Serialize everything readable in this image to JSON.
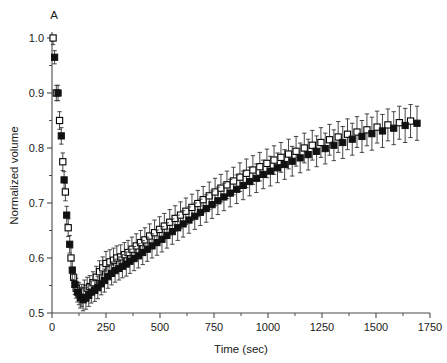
{
  "figure": {
    "panel_label": "A",
    "background": "#ffffff"
  },
  "chart_data": {
    "type": "scatter",
    "title": "",
    "panel_label": "A",
    "xlabel": "Time (sec)",
    "ylabel": "Normalized volume",
    "xlim": [
      0,
      1750
    ],
    "ylim": [
      0.5,
      1.0
    ],
    "xticks": [
      0,
      250,
      500,
      750,
      1000,
      1250,
      1500,
      1750
    ],
    "xticklabels": [
      "0",
      "250",
      "500",
      "750",
      "1000",
      "1250",
      "1500",
      "1750"
    ],
    "xminor_step": 125,
    "yticks": [
      0.5,
      0.6,
      0.7,
      0.8,
      0.9,
      1.0
    ],
    "yticklabels": [
      "0.5",
      "0.6",
      "0.7",
      "0.8",
      "0.9",
      "1.0"
    ],
    "yminor_step": 0.05,
    "grid": false,
    "legend": null,
    "errorbars": "symmetric",
    "marker_colors": {
      "open": "#ffffff",
      "filled": "#111111",
      "edge": "#000000"
    },
    "series": [
      {
        "name": "open-squares",
        "marker": "open-square",
        "x": [
          5,
          20,
          35,
          50,
          62,
          75,
          88,
          100,
          112,
          125,
          138,
          150,
          163,
          175,
          190,
          205,
          220,
          235,
          250,
          268,
          285,
          300,
          318,
          335,
          352,
          370,
          390,
          410,
          430,
          452,
          475,
          498,
          520,
          545,
          570,
          595,
          620,
          648,
          675,
          700,
          728,
          755,
          782,
          810,
          840,
          870,
          900,
          930,
          962,
          995,
          1028,
          1060,
          1095,
          1130,
          1168,
          1205,
          1245,
          1285,
          1325,
          1368,
          1412,
          1458,
          1505,
          1555,
          1608,
          1660
        ],
        "y": [
          1.0,
          0.9,
          0.85,
          0.775,
          0.72,
          0.655,
          0.6,
          0.565,
          0.545,
          0.535,
          0.532,
          0.54,
          0.545,
          0.548,
          0.555,
          0.565,
          0.575,
          0.582,
          0.59,
          0.593,
          0.596,
          0.6,
          0.602,
          0.606,
          0.61,
          0.616,
          0.622,
          0.628,
          0.633,
          0.64,
          0.646,
          0.652,
          0.658,
          0.665,
          0.672,
          0.678,
          0.685,
          0.692,
          0.699,
          0.706,
          0.713,
          0.72,
          0.727,
          0.733,
          0.74,
          0.747,
          0.754,
          0.76,
          0.766,
          0.772,
          0.778,
          0.783,
          0.789,
          0.794,
          0.8,
          0.805,
          0.81,
          0.815,
          0.82,
          0.825,
          0.829,
          0.833,
          0.838,
          0.842,
          0.846,
          0.849
        ],
        "yerr": [
          0.012,
          0.014,
          0.016,
          0.016,
          0.016,
          0.016,
          0.018,
          0.018,
          0.018,
          0.02,
          0.02,
          0.02,
          0.02,
          0.02,
          0.02,
          0.02,
          0.02,
          0.02,
          0.022,
          0.022,
          0.022,
          0.022,
          0.022,
          0.022,
          0.022,
          0.022,
          0.022,
          0.022,
          0.022,
          0.022,
          0.023,
          0.023,
          0.023,
          0.023,
          0.023,
          0.024,
          0.024,
          0.024,
          0.024,
          0.024,
          0.025,
          0.025,
          0.025,
          0.025,
          0.025,
          0.026,
          0.026,
          0.026,
          0.026,
          0.026,
          0.026,
          0.027,
          0.027,
          0.027,
          0.027,
          0.027,
          0.027,
          0.028,
          0.028,
          0.028,
          0.028,
          0.029,
          0.029,
          0.029,
          0.03,
          0.03
        ]
      },
      {
        "name": "filled-squares",
        "marker": "filled-square",
        "x": [
          12,
          28,
          43,
          56,
          68,
          82,
          94,
          106,
          118,
          131,
          144,
          157,
          170,
          182,
          198,
          212,
          228,
          243,
          259,
          276,
          292,
          310,
          326,
          344,
          361,
          380,
          400,
          420,
          441,
          463,
          486,
          509,
          532,
          557,
          582,
          607,
          634,
          661,
          687,
          714,
          741,
          768,
          796,
          825,
          855,
          885,
          915,
          946,
          978,
          1011,
          1044,
          1077,
          1112,
          1149,
          1186,
          1225,
          1265,
          1305,
          1346,
          1390,
          1435,
          1481,
          1530,
          1582,
          1635,
          1690
        ],
        "y": [
          0.965,
          0.9,
          0.822,
          0.742,
          0.678,
          0.625,
          0.578,
          0.552,
          0.538,
          0.528,
          0.524,
          0.527,
          0.532,
          0.538,
          0.541,
          0.546,
          0.553,
          0.559,
          0.566,
          0.572,
          0.577,
          0.581,
          0.585,
          0.589,
          0.594,
          0.599,
          0.604,
          0.61,
          0.616,
          0.622,
          0.628,
          0.634,
          0.641,
          0.648,
          0.655,
          0.662,
          0.669,
          0.676,
          0.683,
          0.69,
          0.697,
          0.704,
          0.711,
          0.718,
          0.725,
          0.732,
          0.739,
          0.745,
          0.752,
          0.758,
          0.764,
          0.77,
          0.776,
          0.782,
          0.788,
          0.794,
          0.799,
          0.805,
          0.81,
          0.816,
          0.821,
          0.826,
          0.831,
          0.836,
          0.841,
          0.845
        ],
        "yerr": [
          0.012,
          0.014,
          0.015,
          0.015,
          0.016,
          0.016,
          0.017,
          0.018,
          0.018,
          0.019,
          0.02,
          0.02,
          0.02,
          0.02,
          0.02,
          0.02,
          0.02,
          0.021,
          0.021,
          0.021,
          0.021,
          0.021,
          0.021,
          0.022,
          0.022,
          0.022,
          0.022,
          0.022,
          0.022,
          0.022,
          0.023,
          0.023,
          0.023,
          0.023,
          0.023,
          0.024,
          0.024,
          0.024,
          0.024,
          0.025,
          0.025,
          0.025,
          0.025,
          0.025,
          0.026,
          0.026,
          0.026,
          0.026,
          0.026,
          0.027,
          0.027,
          0.027,
          0.027,
          0.027,
          0.028,
          0.028,
          0.028,
          0.028,
          0.029,
          0.029,
          0.029,
          0.03,
          0.03,
          0.03,
          0.031,
          0.031
        ]
      }
    ]
  }
}
